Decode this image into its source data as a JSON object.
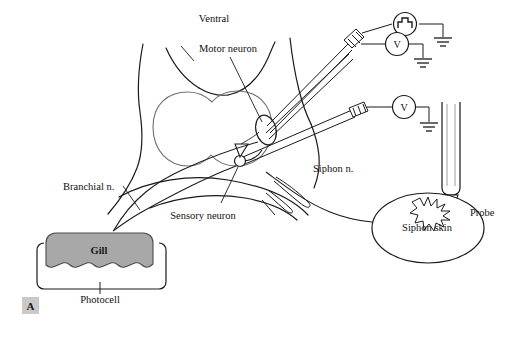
{
  "figure": {
    "panel_letter": "A",
    "background_color": "#ffffff",
    "line_color": "#1a1a1a",
    "ganglion_line_color": "#6f6f6f",
    "gill_fill_color": "#a8a8a8",
    "panel_box_color": "#c9c9c9"
  },
  "labels": {
    "ventral": "Ventral",
    "motor_neuron": "Motor neuron",
    "sensory_neuron": "Sensory neuron",
    "branchial_nerve": "Branchial n.",
    "siphon_nerve": "Siphon n.",
    "siphon_skin": "Siphon skin",
    "probe": "Probe",
    "gill": "Gill",
    "photocell": "Photocell"
  },
  "instruments": {
    "stimulator": {
      "name": "pulse-stimulator",
      "glyph": "square-wave",
      "ground": "earth-ground"
    },
    "voltmeter_motor": {
      "name": "voltmeter",
      "glyph": "V",
      "ground": "earth-ground"
    },
    "voltmeter_sensory": {
      "name": "voltmeter",
      "glyph": "V",
      "ground": "earth-ground"
    }
  },
  "structures": {
    "ganglion": "abdominal-ganglion",
    "motor_neuron_soma": "motor-neuron-cell-body",
    "sensory_neuron_soma": "sensory-neuron-cell-body",
    "synapse": "synaptic-terminal",
    "stimulus_mark": "tactile-stimulus-burst",
    "electrodes": [
      "motor-neuron-microelectrode-pair",
      "sensory-neuron-microelectrode"
    ]
  }
}
